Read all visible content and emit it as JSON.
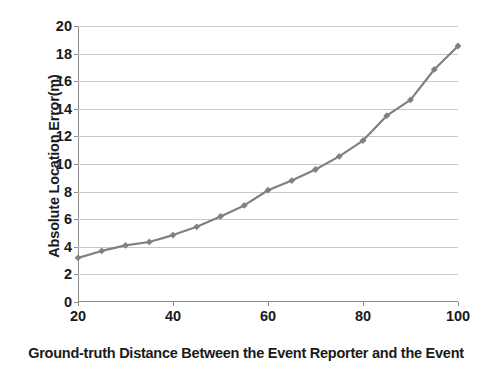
{
  "chart_data": {
    "type": "line",
    "title": "",
    "xlabel": "Ground-truth Distance Between the Event Reporter and the Event",
    "ylabel": "Absolute Location Error(m)",
    "xlim": [
      20,
      100
    ],
    "ylim": [
      0,
      20
    ],
    "xticks": [
      20,
      40,
      60,
      80,
      100
    ],
    "xtick_labels": [
      "20",
      "40",
      "60",
      "80",
      "100"
    ],
    "yticks": [
      0,
      2,
      4,
      6,
      8,
      10,
      12,
      14,
      16,
      18,
      20
    ],
    "ytick_labels": [
      "0",
      "2",
      "4",
      "6",
      "8",
      "10",
      "12",
      "14",
      "16",
      "18",
      "20"
    ],
    "grid": "horizontal",
    "legend": "none",
    "series": [
      {
        "name": "Absolute Location Error",
        "color": "#808080",
        "marker": "diamond",
        "x": [
          20,
          25,
          30,
          35,
          40,
          45,
          50,
          55,
          60,
          65,
          70,
          75,
          80,
          85,
          90,
          95,
          100
        ],
        "values": [
          3.2,
          3.7,
          4.1,
          4.35,
          4.85,
          5.45,
          6.2,
          7.0,
          8.1,
          8.8,
          9.6,
          10.55,
          11.7,
          13.5,
          14.65,
          16.85,
          18.55
        ]
      }
    ]
  },
  "style": {
    "series_color": "#808080",
    "gridline_color": "#c8c8c8",
    "axis_color": "#8c8c8c",
    "text_color": "#1a1a1a",
    "background": "#ffffff"
  }
}
